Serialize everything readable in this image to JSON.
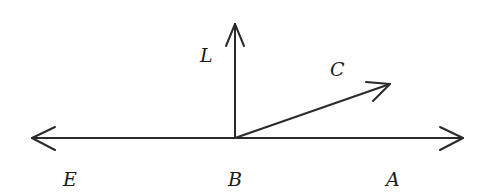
{
  "diagram": {
    "type": "rays-from-point",
    "colors": {
      "stroke": "#2a2a2a",
      "text": "#1a1a1a",
      "background": "#ffffff"
    },
    "vertex": {
      "name": "B",
      "x": 235,
      "y": 138
    },
    "rays": [
      {
        "id": "BA",
        "direction": "right",
        "to_label": "A",
        "tip": [
          463,
          138
        ]
      },
      {
        "id": "BE",
        "direction": "left",
        "to_label": "E",
        "tip": [
          32,
          138
        ]
      },
      {
        "id": "BL",
        "direction": "up",
        "to_label": "L",
        "tip": [
          235,
          24
        ]
      },
      {
        "id": "BC",
        "direction": "up-right",
        "to_label": "C",
        "tip": [
          390,
          84
        ]
      }
    ],
    "labels": {
      "A": "A",
      "B": "B",
      "C": "C",
      "E": "E",
      "L": "L"
    }
  }
}
